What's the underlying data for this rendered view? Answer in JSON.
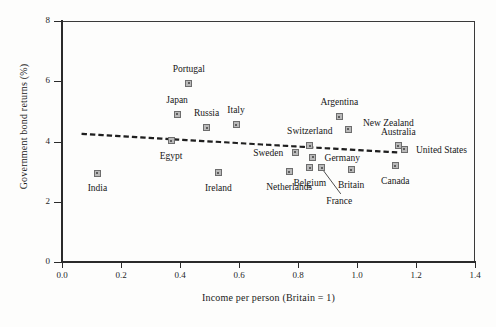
{
  "chart_data": {
    "type": "scatter",
    "title": "",
    "xlabel": "Income per person (Britain = 1)",
    "ylabel": "Government bond returns (%)",
    "xlim": [
      0.0,
      1.4
    ],
    "ylim": [
      0,
      8
    ],
    "xticks": [
      "0.0",
      "0.2",
      "0.4",
      "0.6",
      "0.8",
      "1.0",
      "1.2",
      "1.4"
    ],
    "xtick_values": [
      0.0,
      0.2,
      0.4,
      0.6,
      0.8,
      1.0,
      1.2,
      1.4
    ],
    "yticks": [
      "0",
      "2",
      "4",
      "6",
      "8"
    ],
    "ytick_values": [
      0,
      2,
      4,
      6,
      8
    ],
    "grid": false,
    "legend": "none",
    "marker_style": "filled-square-grey",
    "points": [
      {
        "label": "India",
        "x": 0.12,
        "y": 2.95,
        "lx": 0.12,
        "ly": 2.45,
        "align": "c"
      },
      {
        "label": "Portugal",
        "x": 0.43,
        "y": 5.93,
        "lx": 0.43,
        "ly": 6.42,
        "align": "c"
      },
      {
        "label": "Japan",
        "x": 0.39,
        "y": 4.9,
        "lx": 0.39,
        "ly": 5.38,
        "align": "c"
      },
      {
        "label": "Egypt",
        "x": 0.37,
        "y": 4.02,
        "lx": 0.37,
        "ly": 3.52,
        "align": "c"
      },
      {
        "label": "Russia",
        "x": 0.49,
        "y": 4.46,
        "lx": 0.49,
        "ly": 4.93,
        "align": "c"
      },
      {
        "label": "Italy",
        "x": 0.59,
        "y": 4.56,
        "lx": 0.59,
        "ly": 5.03,
        "align": "c"
      },
      {
        "label": "Ireland",
        "x": 0.53,
        "y": 2.96,
        "lx": 0.53,
        "ly": 2.47,
        "align": "c"
      },
      {
        "label": "Netherlands",
        "x": 0.77,
        "y": 3.0,
        "lx": 0.77,
        "ly": 2.5,
        "align": "c"
      },
      {
        "label": "Sweden",
        "x": 0.79,
        "y": 3.65,
        "lx": 0.75,
        "ly": 3.62,
        "align": "l"
      },
      {
        "label": "Switzerland",
        "x": 0.84,
        "y": 3.86,
        "lx": 0.84,
        "ly": 4.36,
        "align": "c"
      },
      {
        "label": "Germany",
        "x": 0.85,
        "y": 3.47,
        "lx": 0.89,
        "ly": 3.44,
        "align": "r"
      },
      {
        "label": "Belgium",
        "x": 0.84,
        "y": 3.13,
        "lx": 0.84,
        "ly": 2.63,
        "align": "c"
      },
      {
        "label": "France",
        "x": 0.88,
        "y": 3.13,
        "lx": 0.94,
        "ly": 2.04,
        "align": "c"
      },
      {
        "label": "Britain",
        "x": 0.98,
        "y": 3.07,
        "lx": 0.98,
        "ly": 2.57,
        "align": "c"
      },
      {
        "label": "Argentina",
        "x": 0.94,
        "y": 4.82,
        "lx": 0.94,
        "ly": 5.3,
        "align": "c"
      },
      {
        "label": "New Zealand",
        "x": 0.97,
        "y": 4.4,
        "lx": 1.02,
        "ly": 4.62,
        "align": "r"
      },
      {
        "label": "Australia",
        "x": 1.14,
        "y": 3.86,
        "lx": 1.14,
        "ly": 4.33,
        "align": "c"
      },
      {
        "label": "United States",
        "x": 1.16,
        "y": 3.74,
        "lx": 1.2,
        "ly": 3.71,
        "align": "r"
      },
      {
        "label": "Canada",
        "x": 1.13,
        "y": 3.2,
        "lx": 1.13,
        "ly": 2.7,
        "align": "c"
      }
    ],
    "trendline": {
      "style": "dotted",
      "x_start": 0.07,
      "y_start": 4.25,
      "x_end": 1.15,
      "y_end": 3.63
    },
    "leader_lines": [
      {
        "label": "France",
        "x1": 0.885,
        "y1": 3.05,
        "x2": 0.945,
        "y2": 2.26
      }
    ]
  },
  "colors": {
    "marker_fill": "#b9b9b9",
    "marker_edge": "#6d6d6d",
    "axis": "#2b2b2b",
    "text": "#161616",
    "background": "#fdfdfc",
    "trendline": "#1f1f1f"
  }
}
